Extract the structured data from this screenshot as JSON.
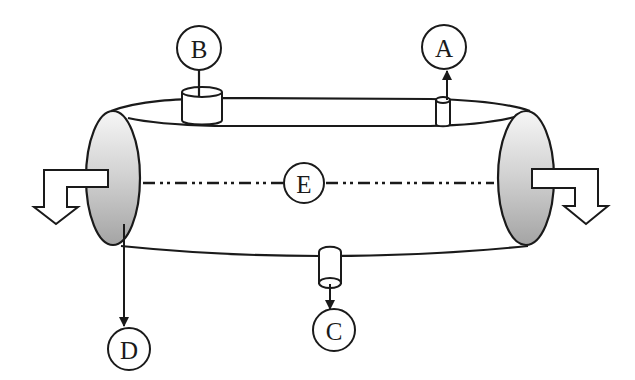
{
  "diagram": {
    "type": "labeled schematic",
    "colors": {
      "line": "#1a1a1a",
      "end_face_light": "#f4f4f4",
      "end_face_dark": "#a8a8a8",
      "background": "#ffffff"
    },
    "labels": {
      "A": "A",
      "B": "B",
      "C": "C",
      "D": "D",
      "E": "E"
    },
    "components": [
      {
        "id": "A",
        "meaning": "small top nozzle with upward arrow (outlet)"
      },
      {
        "id": "B",
        "meaning": "large top nozzle with connection line"
      },
      {
        "id": "C",
        "meaning": "bottom nozzle with downward arrow (outlet)"
      },
      {
        "id": "D",
        "meaning": "line from left end face with downward arrow"
      },
      {
        "id": "E",
        "meaning": "central axis of vessel (dash-dot line)"
      }
    ],
    "flow_arrows": [
      {
        "position": "left",
        "direction": "out-left-then-down"
      },
      {
        "position": "right",
        "direction": "out-right-then-down"
      }
    ]
  }
}
